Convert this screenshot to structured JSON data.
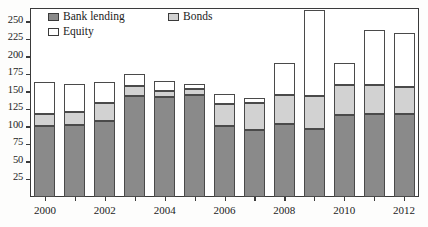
{
  "chart_data": {
    "type": "bar",
    "subtype": "stacked-vertical",
    "title": "",
    "subtitle": "",
    "xlabel": "",
    "ylabel": "",
    "grid": false,
    "legend_position": "inside-top-left",
    "xlim_categories": [
      "2000",
      "2001",
      "2002",
      "2003",
      "2004",
      "2005",
      "2006",
      "2007",
      "2008",
      "2009",
      "2010",
      "2011",
      "2012"
    ],
    "categories": [
      "2000",
      "2001",
      "2002",
      "2003",
      "2004",
      "2005",
      "2006",
      "2007",
      "2008",
      "2009",
      "2010",
      "2011",
      "2012"
    ],
    "x_tick_labels": [
      "2000",
      "2002",
      "2004",
      "2006",
      "2008",
      "2010",
      "2012"
    ],
    "ylim": [
      0,
      270
    ],
    "y_ticks": [
      25,
      50,
      75,
      100,
      125,
      150,
      175,
      200,
      225,
      250
    ],
    "y_tick_labels": [
      "25",
      "50",
      "75",
      "100",
      "125",
      "150",
      "175",
      "200",
      "225",
      "250"
    ],
    "series": [
      {
        "name": "Bank lending",
        "color": "#8a8a8a",
        "values": [
          101,
          103,
          109,
          145,
          143,
          146,
          101,
          96,
          104,
          97,
          117,
          118,
          119
        ]
      },
      {
        "name": "Bonds",
        "color": "#d2d2d2",
        "values": [
          17,
          19,
          25,
          13,
          9,
          8,
          32,
          38,
          42,
          48,
          43,
          42,
          38
        ]
      },
      {
        "name": "Equity",
        "color": "#ffffff",
        "values": [
          47,
          39,
          31,
          18,
          14,
          8,
          14,
          8,
          45,
          122,
          31,
          79,
          77
        ]
      }
    ],
    "totals": [
      165,
      161,
      165,
      176,
      166,
      162,
      147,
      142,
      191,
      267,
      191,
      239,
      234
    ]
  },
  "legend": {
    "entries": [
      {
        "label": "Bank lending",
        "swatch": "#8a8a8a"
      },
      {
        "label": "Bonds",
        "swatch": "#d2d2d2"
      },
      {
        "label": "Equity",
        "swatch": "#ffffff"
      }
    ]
  }
}
